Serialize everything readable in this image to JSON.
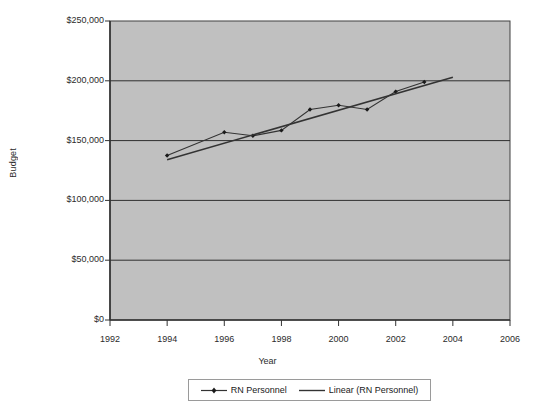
{
  "chart_data": {
    "type": "line",
    "title": "",
    "xlabel": "Year",
    "ylabel": "Budget",
    "xlim": [
      1992,
      2006
    ],
    "ylim": [
      0,
      250000
    ],
    "grid": true,
    "grid_axis": "y",
    "legend_position": "bottom",
    "plot_background": "#c0c0c0",
    "line_color": "#333333",
    "marker": "diamond",
    "x_ticks": [
      1992,
      1994,
      1996,
      1998,
      2000,
      2002,
      2004,
      2006
    ],
    "x_tick_labels": [
      "1992",
      "1994",
      "1996",
      "1998",
      "2000",
      "2002",
      "2004",
      "2006"
    ],
    "y_ticks": [
      0,
      50000,
      100000,
      150000,
      200000,
      250000
    ],
    "y_tick_labels": [
      "$0",
      "$50,000",
      "$100,000",
      "$150,000",
      "$200,000",
      "$250,000"
    ],
    "series": [
      {
        "name": "RN Personnel",
        "kind": "line-markers",
        "x": [
          1994,
          1996,
          1997,
          1998,
          1999,
          2000,
          2001,
          2002,
          2003
        ],
        "values": [
          137500,
          157000,
          154000,
          158500,
          176000,
          179500,
          176000,
          191000,
          199000
        ]
      },
      {
        "name": "Linear (RN Personnel)",
        "kind": "trendline",
        "x": [
          1994,
          2004
        ],
        "values": [
          134000,
          203000
        ]
      }
    ]
  },
  "legend": {
    "entries": [
      {
        "label": "RN Personnel",
        "marker": "diamond-line",
        "color": "#333333"
      },
      {
        "label": "Linear (RN Personnel)",
        "marker": "line",
        "color": "#333333"
      }
    ]
  },
  "axes": {
    "y_title": "Budget",
    "x_title": "Year"
  }
}
